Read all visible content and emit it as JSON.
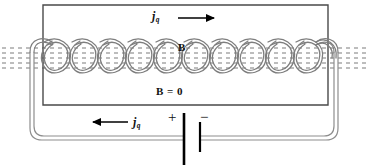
{
  "figure": {
    "background_color": "#ffffff",
    "width": 368,
    "height": 165
  },
  "labels": {
    "current_top": {
      "symbol": "j",
      "subscript": "q"
    },
    "current_bottom": {
      "symbol": "j",
      "subscript": "q"
    },
    "field_inside": "B",
    "field_outside": "B = 0",
    "battery_positive": "+",
    "battery_negative": "−"
  },
  "colors": {
    "wire_dark": "#444444",
    "wire_light": "#9a9a9a",
    "field_line": "#a0a0a0",
    "text": "#111111",
    "arrow": "#000000",
    "battery_plate": "#000000"
  },
  "geometry": {
    "inner_rect": {
      "x": 43,
      "y": 5,
      "width": 285,
      "height": 100
    },
    "coil": {
      "turns": 11,
      "left_x": 30,
      "right_x": 338,
      "center_y": 58,
      "loop_height": 36,
      "loop_width": 31
    },
    "field_lines": {
      "count": 5,
      "spacing": 5,
      "center_y": 58,
      "x_start": 2,
      "x_end": 366,
      "dash": "4 4"
    },
    "outer_loop": {
      "left_x": 16,
      "right_x": 352,
      "bottom_y": 140,
      "corner_radius": 12
    },
    "battery": {
      "positive_plate_x": 184,
      "positive_plate_top": 113,
      "positive_plate_bottom": 165,
      "negative_plate_x": 200,
      "negative_plate_top": 122,
      "negative_plate_bottom": 152
    },
    "arrow_top": {
      "x1": 178,
      "x2": 218,
      "y": 18
    },
    "arrow_bottom": {
      "x1": 128,
      "x2": 88,
      "y": 122
    }
  }
}
